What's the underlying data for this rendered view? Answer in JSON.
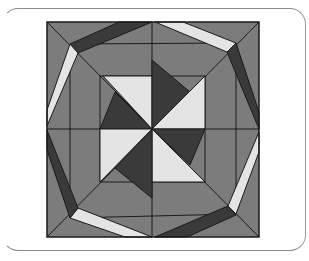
{
  "figure": {
    "colors": {
      "medium": "#7c7c7c",
      "dark": "#3a3a3a",
      "light": "#e4e4e4",
      "line": "#1a1a1a",
      "frame": "#8a8a8a"
    },
    "square": {
      "x": 47,
      "y": 22,
      "w": 212,
      "h": 215
    },
    "center": {
      "x": 152,
      "y": 129
    },
    "pieces": [
      {
        "name": "band-top-left-dark",
        "tone": "dark",
        "points": "70,44 119,22 152,22 78,53"
      },
      {
        "name": "band-top-right-light",
        "tone": "light",
        "points": "155,22 183,22 236,43 227,52"
      },
      {
        "name": "band-right-top-dark",
        "tone": "dark",
        "points": "236,43 259,112 259,129 227,52"
      },
      {
        "name": "band-right-bottom-light",
        "tone": "light",
        "points": "259,132 259,152 236,214 228,206"
      },
      {
        "name": "band-bottom-right-dark",
        "tone": "dark",
        "points": "228,206 236,215 187,237 155,237"
      },
      {
        "name": "band-bottom-left-light",
        "tone": "light",
        "points": "152,237 125,237 70,218 78,208"
      },
      {
        "name": "band-left-bottom-dark",
        "tone": "dark",
        "points": "70,218 47,150 47,130 78,208"
      },
      {
        "name": "band-left-top-light",
        "tone": "light",
        "points": "47,126 47,110 70,44 78,53"
      },
      {
        "name": "inner-tl-light",
        "tone": "light",
        "points": "103,76 152,76 152,129"
      },
      {
        "name": "inner-tl-dark",
        "tone": "dark",
        "points": "115,92 152,129 100,129"
      },
      {
        "name": "inner-tr-dark",
        "tone": "dark",
        "points": "152,60 190,92 152,129"
      },
      {
        "name": "inner-tr-light",
        "tone": "light",
        "points": "205,76 205,129 152,129"
      },
      {
        "name": "inner-br-dark",
        "tone": "dark",
        "points": "152,129 205,129 190,165"
      },
      {
        "name": "inner-br-light",
        "tone": "light",
        "points": "152,129 205,182 152,182"
      },
      {
        "name": "inner-bl-dark",
        "tone": "dark",
        "points": "152,129 152,198 115,168"
      },
      {
        "name": "inner-bl-light",
        "tone": "light",
        "points": "100,129 152,129 100,182"
      }
    ],
    "lines": [
      "47,22 259,237",
      "259,22 47,237",
      "152,22 152,237",
      "47,129 259,129",
      "70,44 236,43",
      "236,43 236,214",
      "236,214 70,218",
      "70,218 70,44",
      "100,76 205,76",
      "100,182 205,182",
      "100,76 100,182",
      "205,76 205,182"
    ]
  }
}
